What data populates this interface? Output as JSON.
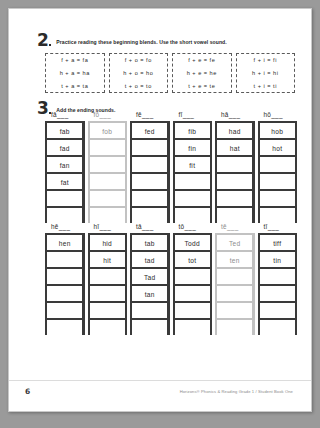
{
  "page": {
    "number": "6",
    "footer_credit": "Horizons® Phonics & Reading Grade 1 / Student Book One"
  },
  "exercise_2": {
    "number": "2",
    "instruction": "Practice reading these beginning blends. Use the short vowel sound.",
    "blend_boxes": [
      {
        "lines": [
          "f + a = fa",
          "h + a = ha",
          "t + a = ta"
        ]
      },
      {
        "lines": [
          "f + o = fo",
          "h + o = ho",
          "t + o = to"
        ]
      },
      {
        "lines": [
          "f + e = fe",
          "h + e = he",
          "t + e = te"
        ]
      },
      {
        "lines": [
          "f + i = fi",
          "h + i = hi",
          "t + i = ti"
        ]
      }
    ]
  },
  "exercise_3": {
    "number": "3",
    "instruction": "Add the ending sounds.",
    "ladder_rows": [
      {
        "ladders": [
          {
            "header": "fă___",
            "style": "dark",
            "words": [
              "fab",
              "fad",
              "fan",
              "fat"
            ]
          },
          {
            "header": "fŏ___",
            "style": "light",
            "words": [
              "fob",
              "",
              "",
              ""
            ]
          },
          {
            "header": "fĕ___",
            "style": "dark",
            "words": [
              "fed",
              "",
              "",
              ""
            ]
          },
          {
            "header": "fĭ___",
            "style": "dark",
            "words": [
              "fib",
              "fin",
              "fit",
              ""
            ]
          },
          {
            "header": "hă___",
            "style": "dark",
            "words": [
              "had",
              "hat",
              "",
              ""
            ]
          },
          {
            "header": "hŏ___",
            "style": "dark",
            "words": [
              "hob",
              "hot",
              "",
              ""
            ]
          }
        ]
      },
      {
        "ladders": [
          {
            "header": "hĕ___",
            "style": "dark",
            "words": [
              "hen",
              "",
              "",
              ""
            ]
          },
          {
            "header": "hĭ___",
            "style": "dark",
            "words": [
              "hid",
              "hit",
              "",
              ""
            ]
          },
          {
            "header": "tă___",
            "style": "dark",
            "words": [
              "tab",
              "tad",
              "Tad",
              "tan"
            ]
          },
          {
            "header": "tŏ___",
            "style": "dark",
            "words": [
              "Todd",
              "tot",
              "",
              ""
            ]
          },
          {
            "header": "tĕ___",
            "style": "light",
            "words": [
              "Ted",
              "ten",
              "",
              ""
            ]
          },
          {
            "header": "tĭ___",
            "style": "dark",
            "words": [
              "tiff",
              "tin",
              "",
              ""
            ]
          }
        ]
      }
    ]
  }
}
